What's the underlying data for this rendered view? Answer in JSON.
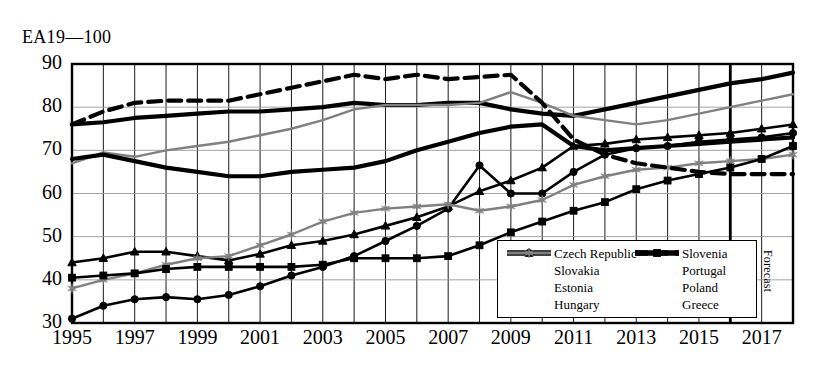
{
  "chart_data": {
    "type": "line",
    "title": "EA19—100",
    "xlabel": "",
    "ylabel": "",
    "ylim": [
      30,
      90
    ],
    "ytick_values": [
      30,
      40,
      50,
      60,
      70,
      80,
      90
    ],
    "xlim": [
      1995,
      2018
    ],
    "xtick_values": [
      1995,
      1997,
      1999,
      2001,
      2003,
      2005,
      2007,
      2009,
      2011,
      2013,
      2015,
      2017
    ],
    "grid": true,
    "legend_position": "inside-bottom-right",
    "annotations": [
      {
        "text": "Forecast",
        "x": 2016,
        "orientation": "vertical"
      }
    ],
    "forecast_divider_x": 2016,
    "x": [
      1995,
      1996,
      1997,
      1998,
      1999,
      2000,
      2001,
      2002,
      2003,
      2004,
      2005,
      2006,
      2007,
      2008,
      2009,
      2010,
      2011,
      2012,
      2013,
      2014,
      2015,
      2016,
      2017,
      2018
    ],
    "series": [
      {
        "name": "Czech Republic",
        "color": "#000000",
        "style": "solid-thick",
        "marker": "none",
        "values": [
          76,
          76.5,
          77.5,
          78,
          78.5,
          79,
          79,
          79.5,
          80,
          81,
          80.5,
          80.5,
          81,
          81,
          79.5,
          78.5,
          78,
          79.5,
          81,
          82.5,
          84,
          85.5,
          86.5,
          88
        ]
      },
      {
        "name": "Slovakia",
        "color": "#000000",
        "style": "solid",
        "marker": "triangle",
        "values": [
          44,
          45,
          46.5,
          46.5,
          45.5,
          44.5,
          46,
          48,
          49,
          50.5,
          52.5,
          54.5,
          57,
          60.5,
          63,
          66,
          71,
          71.5,
          72.5,
          73,
          73.5,
          74,
          75,
          76
        ]
      },
      {
        "name": "Estonia",
        "color": "#000000",
        "style": "solid",
        "marker": "circle",
        "values": [
          31,
          34,
          35.5,
          36,
          35.5,
          36.5,
          38.5,
          41,
          43,
          45.5,
          49,
          52.5,
          56.5,
          66.5,
          60,
          60,
          65,
          69,
          70.5,
          71,
          72,
          72.5,
          73,
          74
        ]
      },
      {
        "name": "Hungary",
        "color": "#808080",
        "style": "solid",
        "marker": "star",
        "values": [
          38,
          40,
          41.5,
          43.5,
          45,
          45.5,
          48,
          50.5,
          53.5,
          55.5,
          56.5,
          57,
          57.5,
          56,
          57,
          58.5,
          62,
          64,
          65.5,
          66,
          67,
          67.5,
          68,
          69
        ]
      },
      {
        "name": "Slovenia",
        "color": "#808080",
        "style": "solid",
        "marker": "none",
        "values": [
          67,
          69.5,
          68.5,
          70,
          71,
          72,
          73.5,
          75,
          77,
          79.5,
          80.5,
          80.5,
          80.5,
          81,
          83.5,
          81,
          78,
          77,
          76,
          77,
          78.5,
          80,
          81.5,
          83
        ]
      },
      {
        "name": "Portugal",
        "color": "#000000",
        "style": "solid-thick",
        "marker": "none",
        "values": [
          68,
          69,
          67.5,
          66,
          65,
          64,
          64,
          65,
          65.5,
          66,
          67.5,
          70,
          72,
          74,
          75.5,
          76,
          71,
          70,
          70.5,
          71,
          71.5,
          72,
          72.5,
          73
        ]
      },
      {
        "name": "Poland",
        "color": "#000000",
        "style": "solid",
        "marker": "square",
        "values": [
          40.5,
          41,
          41.5,
          42.5,
          43,
          43,
          43,
          43,
          43.5,
          45,
          45,
          45,
          45.5,
          48,
          51,
          53.5,
          56,
          58,
          61,
          63,
          64.5,
          66,
          68,
          71
        ]
      },
      {
        "name": "Greece",
        "color": "#000000",
        "style": "dashed",
        "marker": "none",
        "values": [
          76,
          79,
          81,
          81.5,
          81.5,
          81.5,
          83,
          84.5,
          86,
          87.5,
          86.5,
          87.5,
          86.5,
          87,
          87.5,
          81,
          72.5,
          69,
          67,
          66,
          65,
          64.5,
          64.5,
          64.5
        ]
      }
    ]
  },
  "legend": {
    "left_column": [
      "Czech Republic",
      "Slovakia",
      "Estonia",
      "Hungary"
    ],
    "right_column": [
      "Slovenia",
      "Portugal",
      "Poland",
      "Greece"
    ]
  }
}
